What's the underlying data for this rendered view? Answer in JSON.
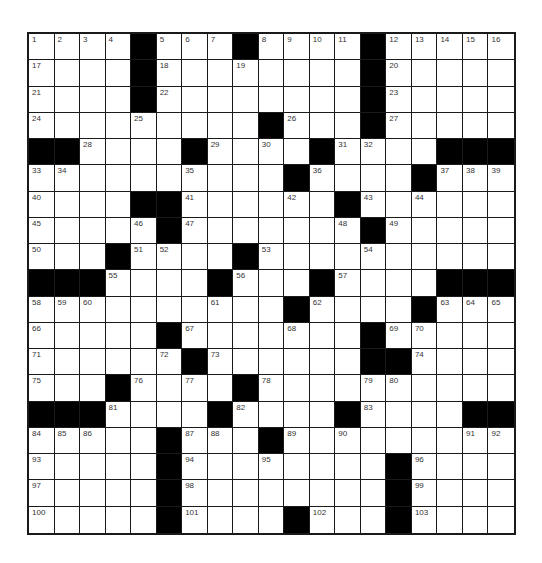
{
  "puzzle": {
    "rows": 19,
    "cols": 19,
    "colors": {
      "block": "#000000",
      "cell": "#ffffff",
      "line": "#1a1a1a",
      "number": "#333333"
    },
    "legend": "Grid values: -1 = black square, 0 = empty white square, N>0 = white square with clue number N",
    "grid": [
      [
        1,
        2,
        3,
        4,
        -1,
        5,
        6,
        7,
        -1,
        8,
        9,
        10,
        11,
        -1,
        12,
        13,
        14,
        15,
        16
      ],
      [
        17,
        0,
        0,
        0,
        -1,
        18,
        0,
        0,
        19,
        0,
        0,
        0,
        0,
        -1,
        20,
        0,
        0,
        0,
        0
      ],
      [
        21,
        0,
        0,
        0,
        -1,
        22,
        0,
        0,
        0,
        0,
        0,
        0,
        0,
        -1,
        23,
        0,
        0,
        0,
        0
      ],
      [
        24,
        0,
        0,
        0,
        25,
        0,
        0,
        0,
        0,
        -1,
        26,
        0,
        0,
        -1,
        27,
        0,
        0,
        0,
        0
      ],
      [
        -1,
        -1,
        28,
        0,
        0,
        0,
        -1,
        29,
        0,
        30,
        0,
        -1,
        31,
        32,
        0,
        0,
        -1,
        -1,
        -1
      ],
      [
        33,
        34,
        0,
        0,
        0,
        0,
        35,
        0,
        0,
        0,
        -1,
        36,
        0,
        0,
        0,
        -1,
        37,
        38,
        39
      ],
      [
        40,
        0,
        0,
        0,
        -1,
        -1,
        41,
        0,
        0,
        0,
        42,
        0,
        -1,
        43,
        0,
        44,
        0,
        0,
        0
      ],
      [
        45,
        0,
        0,
        0,
        46,
        -1,
        47,
        0,
        0,
        0,
        0,
        0,
        48,
        -1,
        49,
        0,
        0,
        0,
        0
      ],
      [
        50,
        0,
        0,
        -1,
        51,
        52,
        0,
        0,
        -1,
        53,
        0,
        0,
        0,
        54,
        0,
        0,
        0,
        0,
        0
      ],
      [
        -1,
        -1,
        -1,
        55,
        0,
        0,
        0,
        -1,
        56,
        0,
        0,
        -1,
        57,
        0,
        0,
        0,
        -1,
        -1,
        -1
      ],
      [
        58,
        59,
        60,
        0,
        0,
        0,
        0,
        61,
        0,
        0,
        -1,
        62,
        0,
        0,
        0,
        -1,
        63,
        64,
        65
      ],
      [
        66,
        0,
        0,
        0,
        0,
        -1,
        67,
        0,
        0,
        0,
        68,
        0,
        0,
        -1,
        69,
        70,
        0,
        0,
        0
      ],
      [
        71,
        0,
        0,
        0,
        0,
        72,
        -1,
        73,
        0,
        0,
        0,
        0,
        0,
        -1,
        -1,
        74,
        0,
        0,
        0
      ],
      [
        75,
        0,
        0,
        -1,
        76,
        0,
        77,
        0,
        -1,
        78,
        0,
        0,
        0,
        79,
        80,
        0,
        0,
        0,
        0
      ],
      [
        -1,
        -1,
        -1,
        81,
        0,
        0,
        0,
        -1,
        82,
        0,
        0,
        0,
        -1,
        83,
        0,
        0,
        0,
        -1,
        -1
      ],
      [
        84,
        85,
        86,
        0,
        0,
        -1,
        87,
        88,
        0,
        -1,
        89,
        0,
        90,
        0,
        0,
        0,
        0,
        91,
        92
      ],
      [
        93,
        0,
        0,
        0,
        0,
        -1,
        94,
        0,
        0,
        95,
        0,
        0,
        0,
        0,
        -1,
        96,
        0,
        0,
        0
      ],
      [
        97,
        0,
        0,
        0,
        0,
        -1,
        98,
        0,
        0,
        0,
        0,
        0,
        0,
        0,
        -1,
        99,
        0,
        0,
        0
      ],
      [
        100,
        0,
        0,
        0,
        0,
        -1,
        101,
        0,
        0,
        0,
        -1,
        102,
        0,
        0,
        -1,
        103,
        0,
        0,
        0
      ]
    ]
  }
}
